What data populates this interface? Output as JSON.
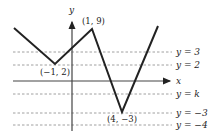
{
  "diagram": {
    "type": "piecewise-linear graph",
    "axes": {
      "x_label": "x",
      "y_label": "y"
    },
    "points": [
      {
        "label": "(1, 9)",
        "x": 1,
        "y": 9
      },
      {
        "label": "(−1, 2)",
        "x": -1,
        "y": 2
      },
      {
        "label": "(4, −3)",
        "x": 4,
        "y": -3
      }
    ],
    "horizontal_lines": [
      {
        "label": "y = 3",
        "value": "3"
      },
      {
        "label": "y = 2",
        "value": "2"
      },
      {
        "label": "y = k",
        "value": "k"
      },
      {
        "label": "y = −3",
        "value": "-3"
      },
      {
        "label": "y = −4",
        "value": "-4"
      }
    ],
    "colors": {
      "line": "#222222",
      "dashed": "#888888",
      "axis": "#444444"
    }
  }
}
